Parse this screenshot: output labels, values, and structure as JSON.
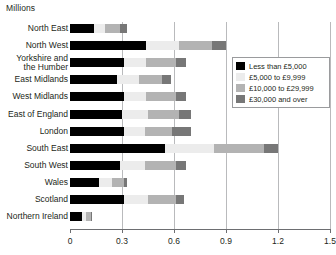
{
  "chart_data": {
    "type": "bar",
    "orientation": "horizontal",
    "stacked": true,
    "title": "Millions",
    "xlabel": "",
    "ylabel": "",
    "xlim": [
      0,
      1.5
    ],
    "xticks": [
      "0",
      "0.3",
      "0.6",
      "0.9",
      "1.2",
      "1.5"
    ],
    "xtick_values": [
      0,
      0.3,
      0.6,
      0.9,
      1.2,
      1.5
    ],
    "grid": true,
    "legend_position": "upper-right-inside",
    "categories": [
      "North East",
      "North West",
      "Yorkshire and\nthe Humber",
      "East Midlands",
      "West Midlands",
      "East of England",
      "London",
      "South East",
      "South West",
      "Wales",
      "Scotland",
      "Northern Ireland"
    ],
    "series": [
      {
        "name": "Less than £5,000",
        "color": "#000000",
        "values": [
          0.14,
          0.44,
          0.31,
          0.27,
          0.31,
          0.3,
          0.31,
          0.55,
          0.29,
          0.17,
          0.31,
          0.07
        ]
      },
      {
        "name": "£5,000 to £9,999",
        "color": "#ececec",
        "values": [
          0.06,
          0.19,
          0.13,
          0.13,
          0.13,
          0.15,
          0.12,
          0.28,
          0.14,
          0.07,
          0.14,
          0.02
        ]
      },
      {
        "name": "£10,000 to £29,999",
        "color": "#b3b3b3",
        "values": [
          0.09,
          0.19,
          0.17,
          0.13,
          0.17,
          0.18,
          0.16,
          0.29,
          0.18,
          0.07,
          0.16,
          0.03
        ]
      },
      {
        "name": "£30,000 and over",
        "color": "#777777",
        "values": [
          0.04,
          0.08,
          0.06,
          0.05,
          0.06,
          0.07,
          0.11,
          0.08,
          0.06,
          0.02,
          0.05,
          0.01
        ]
      }
    ],
    "totals": [
      0.33,
      0.9,
      0.67,
      0.58,
      0.67,
      0.7,
      0.7,
      1.2,
      0.67,
      0.33,
      0.66,
      0.13
    ]
  },
  "legend": {
    "items": [
      {
        "label": "Less than £5,000"
      },
      {
        "label": "£5,000 to £9,999"
      },
      {
        "label": "£10,000 to £29,999"
      },
      {
        "label": "£30,000 and over"
      }
    ]
  }
}
